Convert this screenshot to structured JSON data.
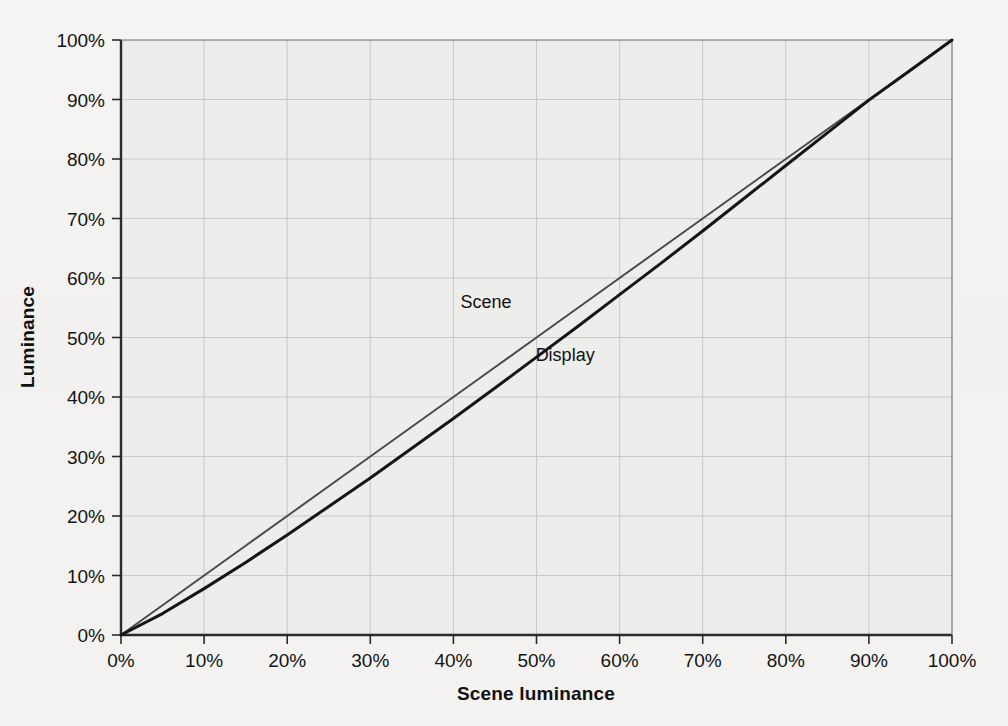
{
  "figure": {
    "paper_background": "#f4f3f1",
    "plot_background": "#ededec",
    "grid_color": "#c9c9c7",
    "axis_color": "#2b2b2b"
  },
  "chart_data": {
    "type": "line",
    "title": "",
    "subtitle": "",
    "xlabel": "Scene luminance",
    "ylabel": "Luminance",
    "xlim": [
      0,
      100
    ],
    "ylim": [
      0,
      100
    ],
    "grid": true,
    "legend": "inline-labels",
    "legend_position": "inline",
    "xticklabels": [
      "0%",
      "10%",
      "20%",
      "30%",
      "40%",
      "50%",
      "60%",
      "70%",
      "80%",
      "90%",
      "100%"
    ],
    "yticklabels": [
      "0%",
      "10%",
      "20%",
      "30%",
      "40%",
      "50%",
      "60%",
      "70%",
      "80%",
      "90%",
      "100%"
    ],
    "xticks": [
      0,
      10,
      20,
      30,
      40,
      50,
      60,
      70,
      80,
      90,
      100
    ],
    "yticks": [
      0,
      10,
      20,
      30,
      40,
      50,
      60,
      70,
      80,
      90,
      100
    ],
    "x": [
      0,
      5,
      10,
      15,
      20,
      25,
      30,
      35,
      40,
      45,
      50,
      55,
      60,
      65,
      70,
      75,
      80,
      85,
      90,
      95,
      100
    ],
    "series": [
      {
        "name": "Scene",
        "color": "#4a4a4a",
        "width": 2.0,
        "label_x": 47,
        "label_y": 55,
        "values": [
          0,
          5,
          10,
          15,
          20,
          25,
          30,
          35,
          40,
          45,
          50,
          55,
          60,
          65,
          70,
          75,
          80,
          85,
          90,
          95,
          100
        ]
      },
      {
        "name": "Display",
        "color": "#151515",
        "width": 3.0,
        "label_x": 57,
        "label_y": 46,
        "values": [
          0,
          3.6,
          7.8,
          12.2,
          16.8,
          21.6,
          26.4,
          31.4,
          36.4,
          41.5,
          46.7,
          51.9,
          57.2,
          62.5,
          67.9,
          73.4,
          78.9,
          84.4,
          89.9,
          94.9,
          100
        ]
      }
    ],
    "annotations": [
      {
        "text": "Scene",
        "x": 47,
        "y": 55
      },
      {
        "text": "Display",
        "x": 57,
        "y": 46
      }
    ]
  },
  "showthrough_text": {
    "note": "faint mirrored bleed-through from reverse page",
    "lines": [
      "channel data is an artifact of a linear signal",
      "sequence of a sample is given by a fixed value",
      "number of values relative to the scene luminance",
      "an observer would see in the real world scene an",
      "brightness of the signal is measured from a linear",
      "the nonlinear relation of the scene luminance and",
      "a gamma correction of 1.2 and no error of the code"
    ]
  }
}
